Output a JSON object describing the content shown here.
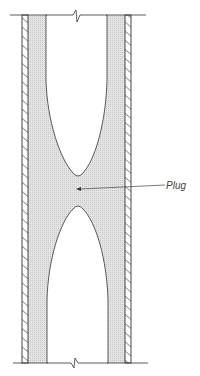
{
  "diagram": {
    "type": "cross-section",
    "labels": {
      "plug": "Plug"
    },
    "colors": {
      "line": "#333333",
      "fill": "#d9d9d9",
      "background": "#ffffff"
    },
    "elements": [
      "top break line",
      "bottom break line",
      "left hatched pipe wall",
      "right hatched pipe wall",
      "annular deposit (stippled)",
      "upper void",
      "lower void",
      "plug region with leader arrow"
    ]
  }
}
